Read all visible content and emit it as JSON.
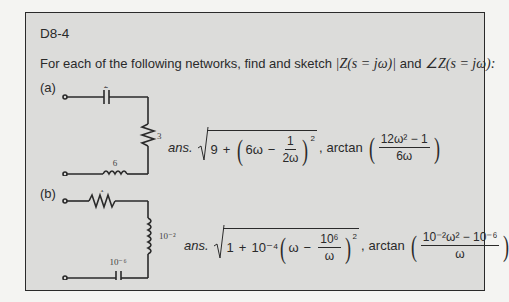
{
  "problem": {
    "id": "D8-4",
    "prompt_text": "For each of the following networks, find and sketch",
    "magnitude_expr": "|Z(s = jω)|",
    "and_text": "and",
    "angle_expr": "∠Z(s = jω):"
  },
  "parts": [
    {
      "label": "(a)",
      "circuit": {
        "capacitor_value": "2",
        "resistor_value": "3",
        "inductor_value": "6"
      },
      "answer": {
        "prefix": "ans.",
        "magnitude": {
          "const": "9",
          "plus": "+",
          "term_lead": "6ω",
          "minus": "−",
          "frac_num": "1",
          "frac_den": "2ω",
          "exponent": "2"
        },
        "separator": ",",
        "arctan_label": "arctan",
        "phase": {
          "num": "12ω² − 1",
          "den": "6ω"
        }
      }
    },
    {
      "label": "(b)",
      "circuit": {
        "resistor_value": "1",
        "inductor_value": "10⁻²",
        "capacitor_value": "10⁻⁶"
      },
      "answer": {
        "prefix": "ans.",
        "magnitude": {
          "const": "1",
          "plus": "+",
          "coef": "10⁻⁴",
          "term_lead": "ω",
          "minus": "−",
          "frac_num": "10⁶",
          "frac_den": "ω",
          "exponent": "2"
        },
        "separator": ",",
        "arctan_label": "arctan",
        "phase": {
          "num": "10⁻²ω² − 10⁻⁶",
          "den": "ω"
        }
      }
    }
  ]
}
